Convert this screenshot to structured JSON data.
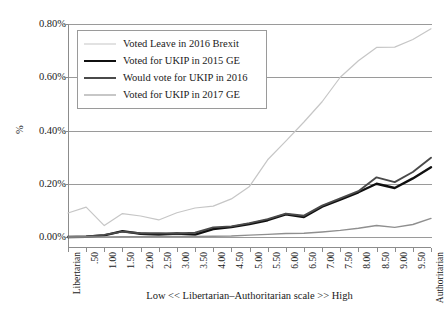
{
  "chart_data": {
    "type": "line",
    "title": "",
    "xlabel": "Low << Libertarian–Authoritarian scale >> High",
    "ylabel": "%",
    "ylim": [
      0,
      0.8
    ],
    "ytick_labels": [
      "0.00%",
      "0.20%",
      "0.40%",
      "0.60%",
      "0.80%"
    ],
    "ytick_values": [
      0,
      0.2,
      0.4,
      0.6,
      0.8
    ],
    "grid": true,
    "legend_position": "top-left-inside",
    "categories": [
      "Libertarian",
      ".50",
      "1.00",
      "1.50",
      "2.00",
      "2.50",
      "3.00",
      "3.50",
      "4.00",
      "4.50",
      "5.00",
      "5.50",
      "6.00",
      "6.50",
      "7.00",
      "7.50",
      "8.00",
      "8.50",
      "9.00",
      "9.50",
      "Authoritarian"
    ],
    "series": [
      {
        "name": "Voted Leave in 2016 Brexit",
        "color": "#c6c6c6",
        "width": 1.2,
        "values": [
          0.09,
          0.112,
          0.043,
          0.088,
          0.079,
          0.064,
          0.091,
          0.109,
          0.116,
          0.143,
          0.19,
          0.29,
          0.36,
          0.432,
          0.508,
          0.6,
          0.662,
          0.712,
          0.713,
          0.742,
          0.782
        ]
      },
      {
        "name": "Voted for UKIP in 2015 GE",
        "color": "#101010",
        "width": 2.4,
        "values": [
          0.0,
          0.001,
          0.006,
          0.022,
          0.012,
          0.009,
          0.013,
          0.009,
          0.03,
          0.037,
          0.049,
          0.063,
          0.085,
          0.075,
          0.114,
          0.14,
          0.168,
          0.2,
          0.184,
          0.22,
          0.262
        ]
      },
      {
        "name": "Would vote for UKIP in 2016",
        "color": "#4a4a4a",
        "width": 1.9,
        "values": [
          0.0,
          0.002,
          0.008,
          0.02,
          0.014,
          0.014,
          0.013,
          0.016,
          0.036,
          0.04,
          0.052,
          0.067,
          0.088,
          0.08,
          0.118,
          0.145,
          0.172,
          0.224,
          0.206,
          0.244,
          0.298
        ]
      },
      {
        "name": "Voted for UKIP in 2017 GE",
        "color": "#8f8f8f",
        "width": 1.4,
        "values": [
          0.0,
          0.0,
          0.0,
          0.001,
          0.001,
          0.002,
          0.002,
          0.002,
          0.003,
          0.004,
          0.007,
          0.01,
          0.013,
          0.014,
          0.019,
          0.025,
          0.033,
          0.043,
          0.036,
          0.047,
          0.07
        ]
      }
    ]
  }
}
